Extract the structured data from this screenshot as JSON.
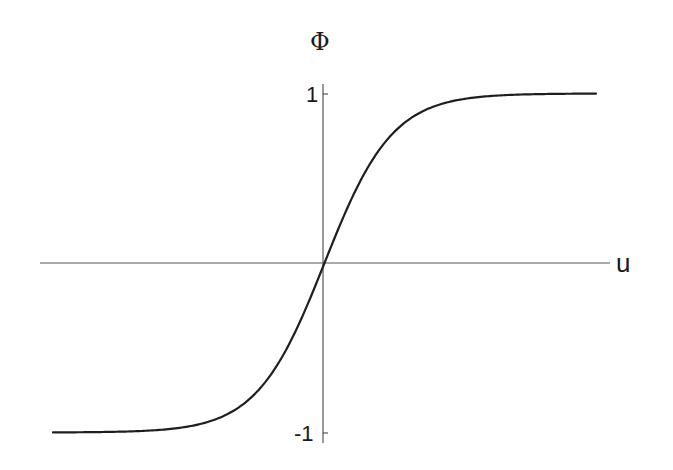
{
  "chart_data": {
    "type": "line",
    "title": "",
    "xlabel": "u",
    "ylabel": "Φ",
    "function": "Φ = tanh(u)",
    "xlim": [
      -4,
      4
    ],
    "ylim": [
      -1,
      1
    ],
    "grid": false,
    "legend": null,
    "yticks": [
      1,
      -1
    ],
    "ytick_labels": [
      "1",
      "-1"
    ],
    "xticks": [],
    "series": [
      {
        "name": "Φ(u)",
        "x": [
          -4,
          -3.5,
          -3,
          -2.5,
          -2,
          -1.5,
          -1,
          -0.75,
          -0.5,
          -0.25,
          0,
          0.25,
          0.5,
          0.75,
          1,
          1.5,
          2,
          2.5,
          3,
          3.5,
          4
        ],
        "values": [
          -0.999,
          -0.998,
          -0.995,
          -0.987,
          -0.964,
          -0.905,
          -0.762,
          -0.635,
          -0.462,
          -0.245,
          0,
          0.245,
          0.462,
          0.635,
          0.762,
          0.905,
          0.964,
          0.987,
          0.995,
          0.998,
          0.999
        ]
      }
    ]
  },
  "labels": {
    "y_axis": "Φ",
    "x_axis": "u",
    "tick_pos": "1",
    "tick_neg": "-1"
  },
  "colors": {
    "curve": "#1e1e1e",
    "axis": "#555555"
  }
}
